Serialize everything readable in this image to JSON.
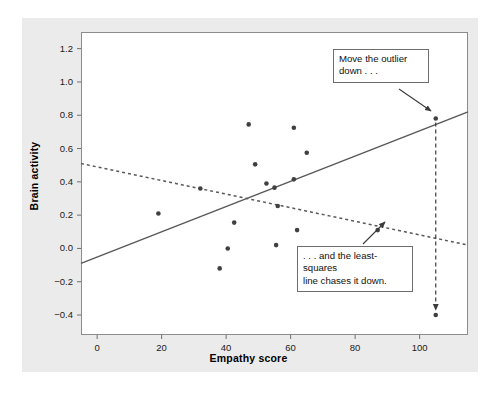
{
  "figure": {
    "background_color": "#ecebeb",
    "panel_color": "#ffffff",
    "frame_color": "#8b8b8b",
    "point_color": "#404040",
    "line_color": "#595959"
  },
  "annotations": [
    {
      "id": "outlier-note",
      "text": "Move the outlier\ndown . . ."
    },
    {
      "id": "least-squares-note",
      "text": ". . . and the least-squares\nline chases it down."
    }
  ],
  "chart_data": {
    "type": "scatter",
    "title": "",
    "xlabel": "Empathy score",
    "ylabel": "Brain activity",
    "xlim": [
      -5,
      115
    ],
    "ylim": [
      -0.52,
      1.3
    ],
    "xticks": [
      0,
      20,
      40,
      60,
      80,
      100
    ],
    "yticks": [
      -0.4,
      -0.2,
      0.0,
      0.2,
      0.4,
      0.6,
      0.8,
      1.0,
      1.2
    ],
    "xticklabels": [
      "0",
      "20",
      "40",
      "60",
      "80",
      "100"
    ],
    "yticklabels": [
      "-0.4",
      "-0.2",
      "0.0",
      "0.2",
      "0.4",
      "0.6",
      "0.8",
      "1.0",
      "1.2"
    ],
    "grid": false,
    "legend": "none",
    "points": [
      {
        "x": 19,
        "y": 0.21
      },
      {
        "x": 32,
        "y": 0.36
      },
      {
        "x": 38,
        "y": -0.12
      },
      {
        "x": 40.5,
        "y": 0.0
      },
      {
        "x": 42.5,
        "y": 0.155
      },
      {
        "x": 47,
        "y": 0.745
      },
      {
        "x": 49,
        "y": 0.505
      },
      {
        "x": 52.5,
        "y": 0.39
      },
      {
        "x": 55,
        "y": 0.365
      },
      {
        "x": 55.5,
        "y": 0.02
      },
      {
        "x": 56,
        "y": 0.255
      },
      {
        "x": 61,
        "y": 0.415
      },
      {
        "x": 61,
        "y": 0.725
      },
      {
        "x": 62,
        "y": 0.11
      },
      {
        "x": 65,
        "y": 0.575
      },
      {
        "x": 87,
        "y": 0.11
      },
      {
        "x": 105,
        "y": 0.78
      }
    ],
    "series": [
      {
        "name": "least-squares line with outlier high",
        "style": "solid",
        "x": [
          -5,
          115
        ],
        "y": [
          -0.09,
          0.82
        ]
      },
      {
        "name": "least-squares line after moving outlier down",
        "style": "dotted",
        "x": [
          -5,
          115
        ],
        "y": [
          0.51,
          0.02
        ]
      }
    ],
    "move_arrow": {
      "from": {
        "x": 105,
        "y": 0.78
      },
      "to": {
        "x": 105,
        "y": -0.4
      },
      "style": "dashed"
    },
    "moved_point": {
      "x": 105,
      "y": -0.4
    }
  }
}
